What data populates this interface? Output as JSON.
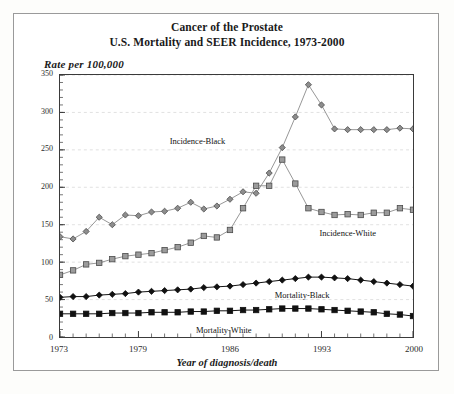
{
  "figure": {
    "title_line1": "Cancer of the Prostate",
    "title_line2": "U.S. Mortality and SEER Incidence, 1973-2000",
    "y_axis_caption": "Rate per 100,000",
    "x_axis_caption": "Year of diagnosis/death"
  },
  "chart_data": {
    "type": "line",
    "xlabel": "Year of diagnosis/death",
    "ylabel": "Rate per 100,000",
    "xlim": [
      1973,
      2000
    ],
    "ylim": [
      0,
      350
    ],
    "ytick_values": [
      0,
      50,
      100,
      150,
      200,
      250,
      300,
      350
    ],
    "xtick_values": [
      1973,
      1979,
      1986,
      1993,
      2000
    ],
    "grid": "horizontal-dashed",
    "legend_position": "inline-annotations",
    "x": [
      1973,
      1974,
      1975,
      1976,
      1977,
      1978,
      1979,
      1980,
      1981,
      1982,
      1983,
      1984,
      1985,
      1986,
      1987,
      1988,
      1989,
      1990,
      1991,
      1992,
      1993,
      1994,
      1995,
      1996,
      1997,
      1998,
      1999,
      2000
    ],
    "series": [
      {
        "name": "Incidence-Black",
        "marker": "diamond",
        "values": [
          134,
          131,
          141,
          160,
          150,
          163,
          162,
          167,
          168,
          172,
          180,
          171,
          175,
          184,
          194,
          192,
          219,
          253,
          294,
          337,
          310,
          278,
          277,
          277,
          277,
          277,
          279,
          278
        ]
      },
      {
        "name": "Incidence-White",
        "marker": "square",
        "values": [
          83,
          89,
          97,
          99,
          104,
          108,
          110,
          112,
          116,
          120,
          126,
          135,
          133,
          143,
          172,
          202,
          202,
          237,
          205,
          172,
          167,
          163,
          164,
          163,
          166,
          166,
          172,
          170
        ]
      },
      {
        "name": "Mortality-Black",
        "marker": "diamond-filled",
        "values": [
          53,
          54,
          54,
          56,
          57,
          58,
          60,
          61,
          62,
          63,
          64,
          66,
          67,
          68,
          70,
          72,
          74,
          76,
          78,
          80,
          80,
          79,
          78,
          76,
          74,
          72,
          70,
          68
        ]
      },
      {
        "name": "Mortality-White",
        "marker": "square-filled",
        "values": [
          31,
          31,
          31,
          31,
          32,
          32,
          32,
          33,
          33,
          33,
          34,
          34,
          35,
          35,
          36,
          36,
          37,
          38,
          38,
          38,
          37,
          36,
          35,
          34,
          33,
          31,
          30,
          28
        ]
      }
    ],
    "annotations": [
      {
        "text": "Incidence-Black",
        "series": "Incidence-Black"
      },
      {
        "text": "Incidence-White",
        "series": "Incidence-White"
      },
      {
        "text": "Mortality-Black",
        "series": "Mortality-Black"
      },
      {
        "text": "Mortality-White",
        "series": "Mortality-White"
      }
    ]
  },
  "colors": {
    "incidence_black": "#6e6e6e",
    "incidence_white": "#6e6e6e",
    "mortality_black": "#111111",
    "mortality_white": "#111111",
    "axis": "#3a3a3a",
    "grid": "#d9d9d9",
    "background": "#ffffff"
  }
}
